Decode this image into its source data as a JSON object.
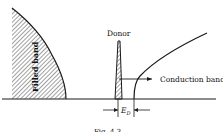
{
  "diagram": {
    "labels": {
      "filled_band": "Filled band",
      "donor": "Donor",
      "conduction_band": "Conduction band",
      "energy_gap": "E",
      "energy_gap_sub": "D"
    },
    "caption": "Fig. 4.3",
    "colors": {
      "line": "#1a1a1a",
      "hatch": "#333333",
      "background": "#ffffff"
    }
  }
}
